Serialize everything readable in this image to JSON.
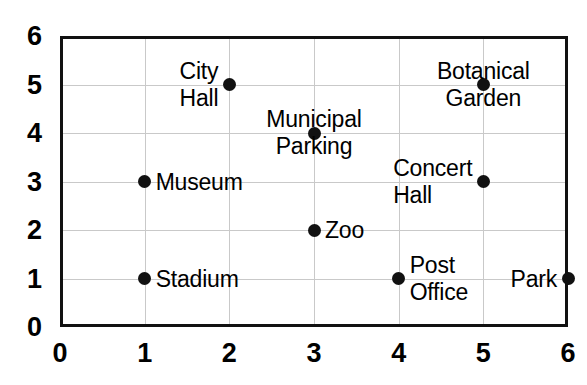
{
  "chart_data": {
    "type": "scatter",
    "title": "",
    "xlabel": "",
    "ylabel": "",
    "xlim": [
      0,
      6
    ],
    "ylim": [
      0,
      6
    ],
    "grid": true,
    "legend": "none",
    "x_ticks": [
      "0",
      "1",
      "2",
      "3",
      "4",
      "5",
      "6"
    ],
    "y_ticks": [
      "0",
      "1",
      "2",
      "3",
      "4",
      "5",
      "6"
    ],
    "points": [
      {
        "label": "Museum",
        "x": 1,
        "y": 3,
        "label_pos": "right",
        "lines": [
          "Museum"
        ]
      },
      {
        "label": "Stadium",
        "x": 1,
        "y": 1,
        "label_pos": "right",
        "lines": [
          "Stadium"
        ]
      },
      {
        "label": "City Hall",
        "x": 2,
        "y": 5,
        "label_pos": "left",
        "lines": [
          "City",
          "Hall"
        ]
      },
      {
        "label": "Municipal Parking",
        "x": 3,
        "y": 4,
        "label_pos": "center",
        "lines": [
          "Municipal",
          "Parking"
        ]
      },
      {
        "label": "Zoo",
        "x": 3,
        "y": 2,
        "label_pos": "right",
        "lines": [
          "Zoo"
        ]
      },
      {
        "label": "Post Office",
        "x": 4,
        "y": 1,
        "label_pos": "right",
        "lines": [
          "Post",
          "Office"
        ]
      },
      {
        "label": "Botanical Garden",
        "x": 5,
        "y": 5,
        "label_pos": "center",
        "lines": [
          "Botanical",
          "Garden"
        ]
      },
      {
        "label": "Concert Hall",
        "x": 5,
        "y": 3,
        "label_pos": "left",
        "lines": [
          "Concert",
          "Hall"
        ]
      },
      {
        "label": "Park",
        "x": 6,
        "y": 1,
        "label_pos": "left",
        "lines": [
          "Park"
        ]
      }
    ],
    "colors": {
      "point": "#111111",
      "frame": "#111111",
      "grid": "#c9c9c9",
      "background": "#ffffff",
      "text": "#000000"
    }
  }
}
